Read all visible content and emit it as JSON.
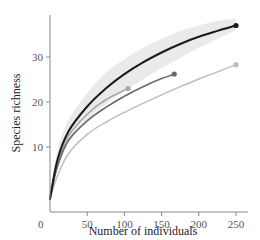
{
  "chart_data": {
    "type": "line",
    "title": "",
    "xlabel": "Number of individuals",
    "ylabel": "Species richness",
    "xlim": [
      0,
      260
    ],
    "ylim": [
      0,
      40
    ],
    "xticks": [
      0,
      50,
      100,
      150,
      200,
      250
    ],
    "yticks": [
      10,
      20,
      30
    ],
    "origin_label": "0",
    "grid": false,
    "legend": null,
    "series": [
      {
        "name": "curve-1-black",
        "color": "#1a1a1a",
        "width": 2.0,
        "has_confidence_band": true,
        "band_color": "#e6e6e6",
        "end_marker": true,
        "x": [
          0,
          10,
          25,
          50,
          75,
          100,
          125,
          150,
          175,
          200,
          225,
          250
        ],
        "y": [
          2,
          8,
          13.5,
          19,
          23,
          26.2,
          28.8,
          31,
          32.9,
          34.5,
          35.8,
          37
        ],
        "band_upper": [
          2,
          9.5,
          16,
          22,
          26.5,
          29.5,
          32,
          34,
          35.8,
          37,
          38,
          38.5
        ],
        "band_lower": [
          2,
          6.5,
          11,
          16,
          19.5,
          22.5,
          25,
          27.5,
          29.8,
          32,
          34,
          36
        ]
      },
      {
        "name": "curve-2-dark-gray",
        "color": "#6a6a6a",
        "width": 1.6,
        "end_marker": true,
        "x": [
          0,
          10,
          25,
          50,
          75,
          100,
          125,
          150,
          167
        ],
        "y": [
          2,
          7,
          11.5,
          15.8,
          18.8,
          21.3,
          23.4,
          25.2,
          26.2
        ]
      },
      {
        "name": "curve-3-light-gray-short",
        "color": "#a8a8a8",
        "width": 1.6,
        "end_marker": true,
        "x": [
          0,
          10,
          25,
          50,
          75,
          105
        ],
        "y": [
          2,
          7.5,
          12.5,
          17.3,
          20.5,
          23
        ]
      },
      {
        "name": "curve-4-light-gray-long",
        "color": "#bdbdbd",
        "width": 1.4,
        "end_marker": true,
        "x": [
          0,
          10,
          25,
          50,
          75,
          100,
          125,
          150,
          175,
          200,
          225,
          250
        ],
        "y": [
          2,
          5.5,
          9,
          12.8,
          15.5,
          17.7,
          19.7,
          21.6,
          23.4,
          25.1,
          26.7,
          28.3
        ]
      }
    ]
  },
  "axes": {
    "x_title": "Number of individuals",
    "y_title": "Species richness",
    "x_tick_labels": [
      "0",
      "50",
      "100",
      "150",
      "200",
      "250"
    ],
    "y_tick_labels": [
      "10",
      "20",
      "30"
    ]
  }
}
